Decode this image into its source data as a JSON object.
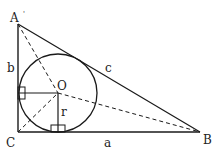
{
  "diagram": {
    "colors": {
      "stroke": "#1a1a1a",
      "background": "#ffffff"
    },
    "points": {
      "A": {
        "label": "A",
        "x": 18,
        "y": 24
      },
      "B": {
        "label": "B",
        "x": 200,
        "y": 132
      },
      "C": {
        "label": "C",
        "x": 18,
        "y": 132
      },
      "O": {
        "label": "O",
        "x": 58,
        "y": 93
      }
    },
    "sides": {
      "a": {
        "label": "a"
      },
      "b": {
        "label": "b"
      },
      "c": {
        "label": "c"
      }
    },
    "incircle": {
      "radius": 39,
      "radius_label": "r"
    },
    "prime_mark": "'"
  }
}
